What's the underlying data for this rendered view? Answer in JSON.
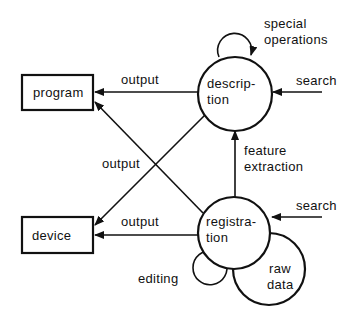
{
  "diagram": {
    "type": "data-flow",
    "nodes": {
      "program": {
        "label": "program",
        "shape": "rectangle"
      },
      "device": {
        "label": "device",
        "shape": "rectangle"
      },
      "description": {
        "label_line1": "descrip-",
        "label_line2": "tion",
        "shape": "circle"
      },
      "registration": {
        "label_line1": "registra-",
        "label_line2": "tion",
        "shape": "circle"
      },
      "raw_data": {
        "label_line1": "raw",
        "label_line2": "data",
        "shape": "circle"
      }
    },
    "edges": {
      "description_to_program": {
        "label": "output"
      },
      "description_to_device": {
        "label": "output"
      },
      "registration_to_program": {
        "label": "output"
      },
      "registration_to_device": {
        "label": "output"
      },
      "registration_to_description": {
        "label_line1": "feature",
        "label_line2": "extraction"
      },
      "search_to_description": {
        "label": "search"
      },
      "search_to_registration": {
        "label": "search"
      },
      "description_self_loop": {
        "label_line1": "special",
        "label_line2": "operations"
      },
      "registration_self_loop": {
        "label": "editing"
      }
    },
    "colors": {
      "stroke": "#111111",
      "background": "#ffffff"
    }
  }
}
